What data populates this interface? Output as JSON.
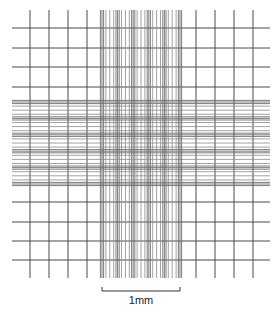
{
  "diagram": {
    "colors": {
      "background": "#ffffff",
      "coarse_line": "#4a4a4a",
      "fine_line": "#8a8a8a",
      "triple_line": "#6e6e6e",
      "scale_bar": "#333333"
    },
    "coarse_grid": {
      "vertical_x": [
        30,
        49,
        68,
        87,
        196,
        215,
        234,
        253
      ],
      "horizontal_y": [
        28,
        48,
        67,
        87,
        202,
        222,
        241,
        260
      ],
      "v_extent": [
        10,
        278
      ],
      "h_extent": [
        12,
        270
      ]
    },
    "center_square": {
      "x0": 102,
      "x1": 180,
      "y0": 102,
      "y1": 184,
      "groups": 5,
      "subdivisions_per_group": 4
    },
    "scale_bar": {
      "x0": 102,
      "x1": 180,
      "y": 291,
      "tick_height": 4,
      "label": "1mm",
      "label_y": 294
    }
  }
}
